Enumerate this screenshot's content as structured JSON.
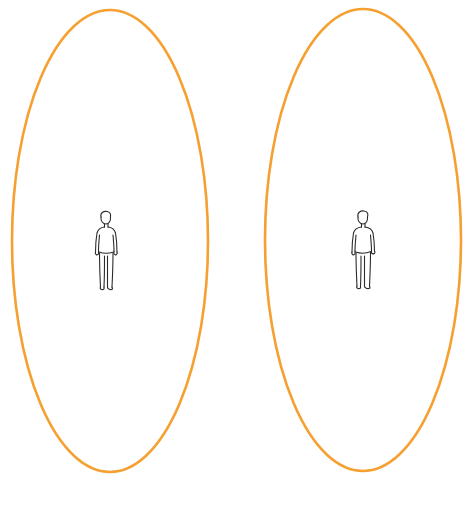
{
  "diagram": {
    "colors": {
      "zone_stroke": "#F5A031",
      "figure_stroke": "#2b2b2b",
      "background": "#ffffff"
    },
    "zones": [
      {
        "id": "left",
        "label": "personal space zone (left)",
        "cx": 110,
        "cy": 241,
        "rx": 98,
        "ry": 231
      },
      {
        "id": "right",
        "label": "personal space zone (right)",
        "cx": 363,
        "cy": 240,
        "rx": 98,
        "ry": 231
      }
    ],
    "figures": [
      {
        "id": "left",
        "label": "standing person (left)",
        "x": 106,
        "top": 213
      },
      {
        "id": "right",
        "label": "standing person (right)",
        "x": 363,
        "top": 213
      }
    ],
    "caption": {
      "text": "",
      "note": "caption line clipped at bottom edge; unreadable"
    }
  }
}
